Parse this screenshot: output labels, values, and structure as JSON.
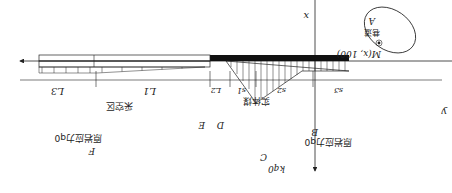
{
  "diagram": {
    "orientation": "rotated 180 degrees",
    "axes": {
      "x_label": "x",
      "y_label": "y"
    },
    "roadway": {
      "point_label": "M(x, 100)",
      "name": "巷道",
      "id": "A"
    },
    "dimensions": {
      "top_row": [
        "L3",
        "L1",
        "L2",
        "s1",
        "s2",
        "s3"
      ]
    },
    "regions": {
      "goaf": "采空区",
      "solid_coal": "实体煤"
    },
    "points": {
      "F": "F",
      "E": "E",
      "D": "D",
      "C": "C",
      "B": "B"
    },
    "loads": {
      "left": "原岩应力q0",
      "right": "原岩应力q0",
      "peak": "kq0"
    }
  }
}
